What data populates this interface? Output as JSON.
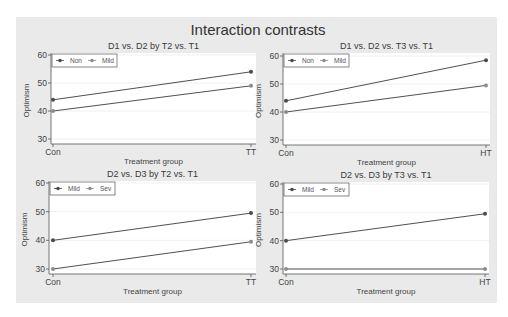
{
  "chart_data": {
    "type": "line",
    "title": "Interaction contrasts",
    "background_color": "#eaeaea",
    "plot_background_color": "#ffffff",
    "grid": true,
    "legend_position": "inside-top-left",
    "ylim": [
      30,
      60
    ],
    "yticks": [
      30,
      40,
      50,
      60
    ],
    "panels": [
      {
        "id": "d1-d2-t2-t1",
        "title": "D1 vs. D2 by T2 vs. T1",
        "xlabel": "Treatment group",
        "ylabel": "Optimism",
        "categories": [
          "Con",
          "TT"
        ],
        "series": [
          {
            "name": "Non",
            "values": [
              44,
              54
            ],
            "color": "#4a4a4a"
          },
          {
            "name": "Mild",
            "values": [
              40,
              49
            ],
            "color": "#8c8c8c"
          }
        ],
        "layout": {
          "x0": 51,
          "x1": 256,
          "y0": 53,
          "y1": 144,
          "ytop": 55,
          "ybot": 139,
          "cx": [
            53,
            251
          ]
        }
      },
      {
        "id": "d1-d2-t3-t1",
        "title": "D1 vs. D2 vs. T3 vs. T1",
        "xlabel": "Treatment group",
        "ylabel": "Optimism",
        "categories": [
          "Con",
          "HT"
        ],
        "series": [
          {
            "name": "Non",
            "values": [
              44,
              58.5
            ],
            "color": "#4a4a4a"
          },
          {
            "name": "Mild",
            "values": [
              40,
              49.5
            ],
            "color": "#8c8c8c"
          }
        ],
        "layout": {
          "x0": 283,
          "x1": 490,
          "y0": 53,
          "y1": 145,
          "ytop": 56,
          "ybot": 140,
          "cx": [
            286,
            486
          ]
        }
      },
      {
        "id": "d2-d3-t2-t1",
        "title": "D2 vs. D3 by T2 vs. T1",
        "xlabel": "Treatment group",
        "ylabel": "Optimism",
        "categories": [
          "Con",
          "TT"
        ],
        "series": [
          {
            "name": "Mild",
            "values": [
              40,
              49.5
            ],
            "color": "#4a4a4a"
          },
          {
            "name": "Sev",
            "values": [
              30,
              39.5
            ],
            "color": "#8c8c8c"
          }
        ],
        "layout": {
          "x0": 49,
          "x1": 256,
          "y0": 181,
          "y1": 274,
          "ytop": 183,
          "ybot": 269,
          "cx": [
            53,
            251
          ]
        }
      },
      {
        "id": "d2-d3-t3-t1",
        "title": "D2 vs. D3 by T3 vs. T1",
        "xlabel": "Treatment group",
        "ylabel": "Optimism",
        "categories": [
          "Con",
          "HT"
        ],
        "series": [
          {
            "name": "Mild",
            "values": [
              40,
              49.5
            ],
            "color": "#4a4a4a"
          },
          {
            "name": "Sev",
            "values": [
              30,
              30
            ],
            "color": "#8c8c8c"
          }
        ],
        "layout": {
          "x0": 283,
          "x1": 489,
          "y0": 182,
          "y1": 274,
          "ytop": 184,
          "ybot": 269,
          "cx": [
            286,
            485
          ]
        }
      }
    ]
  }
}
